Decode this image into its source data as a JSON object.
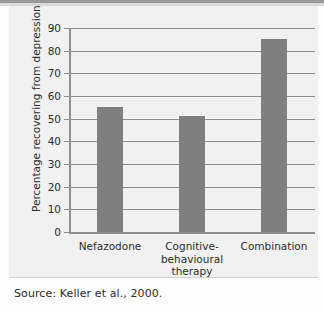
{
  "figure": {
    "source_note": "Source: Keller et al., 2000."
  },
  "chart_data": {
    "type": "bar",
    "title": "",
    "xlabel": "",
    "ylabel": "Percentage recovering from depression",
    "categories": [
      "Nefazodone",
      "Cognitive-behavioural therapy",
      "Combination"
    ],
    "category_lines": [
      [
        "Nefazodone"
      ],
      [
        "Cognitive-",
        "behavioural",
        "therapy"
      ],
      [
        "Combination"
      ]
    ],
    "values": [
      55,
      51,
      85
    ],
    "ylim": [
      0,
      90
    ],
    "yticks": [
      90,
      80,
      70,
      60,
      50,
      40,
      30,
      20,
      10,
      0
    ],
    "ytick_labels": [
      "90",
      "80",
      "70",
      "60",
      "50",
      "40",
      "30",
      "20",
      "10",
      "0"
    ],
    "grid": true,
    "legend": "none",
    "bar_color": "#7f7f7f",
    "axis_color": "#8e8e8e",
    "plot_background": "#f1f1f1",
    "text_color": "#2c2c2c"
  }
}
